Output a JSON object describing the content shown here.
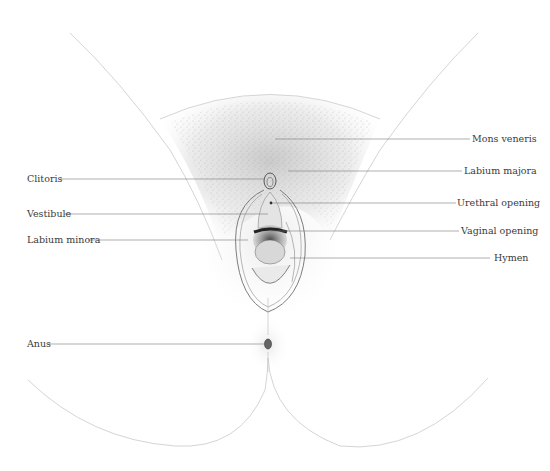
{
  "diagram": {
    "type": "anatomical-illustration",
    "colors": {
      "line": "#8a8a8a",
      "ink": "#3a3a3a",
      "stipple": "#b5b5b5",
      "background": "#ffffff"
    },
    "labels_left": [
      {
        "id": "clitoris",
        "text": "Clitoris"
      },
      {
        "id": "vestibule",
        "text": "Vestibule"
      },
      {
        "id": "labium-minora",
        "text": "Labium minora"
      },
      {
        "id": "anus",
        "text": "Anus"
      }
    ],
    "labels_right": [
      {
        "id": "mons-veneris",
        "text": "Mons veneris"
      },
      {
        "id": "labium-majora",
        "text": "Labium majora"
      },
      {
        "id": "urethral-opening",
        "text": "Urethral opening"
      },
      {
        "id": "vaginal-opening",
        "text": "Vaginal opening"
      },
      {
        "id": "hymen",
        "text": "Hymen"
      }
    ]
  }
}
